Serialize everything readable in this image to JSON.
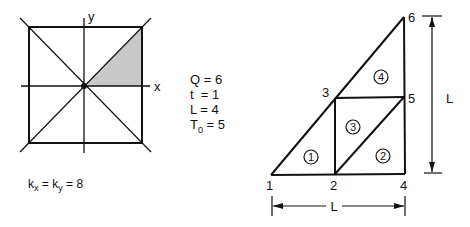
{
  "left_figure": {
    "axis_x_label": "x",
    "axis_y_label": "y",
    "shaded_region": "first-octant triangle",
    "shade_color": "#c8c8c8"
  },
  "parameters": [
    {
      "name": "Q",
      "sub": "",
      "value": "6"
    },
    {
      "name": "t",
      "sub": "",
      "value": "1"
    },
    {
      "name": "L",
      "sub": "",
      "value": "4"
    },
    {
      "name": "T",
      "sub": "0",
      "value": "5"
    }
  ],
  "conductivity": {
    "k1": "k",
    "k1_sub": "x",
    "k2": "k",
    "k2_sub": "y",
    "value": "8"
  },
  "mesh": {
    "nodes": [
      {
        "id": "1",
        "x": 271,
        "y": 175
      },
      {
        "id": "2",
        "x": 335,
        "y": 174
      },
      {
        "id": "3",
        "x": 335,
        "y": 98
      },
      {
        "id": "4",
        "x": 405,
        "y": 173
      },
      {
        "id": "5",
        "x": 404,
        "y": 97
      },
      {
        "id": "6",
        "x": 404,
        "y": 17
      }
    ],
    "elements": [
      {
        "id": "1",
        "nodes": [
          "1",
          "2",
          "3"
        ]
      },
      {
        "id": "2",
        "nodes": [
          "2",
          "4",
          "5"
        ]
      },
      {
        "id": "3",
        "nodes": [
          "2",
          "5",
          "3"
        ]
      },
      {
        "id": "4",
        "nodes": [
          "3",
          "5",
          "6"
        ]
      }
    ],
    "dim_horizontal_label": "L",
    "dim_vertical_label": "L"
  }
}
